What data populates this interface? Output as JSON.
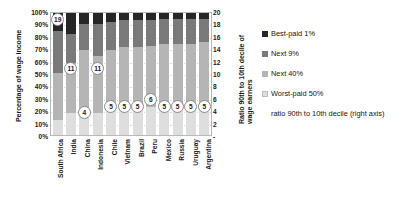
{
  "chart_data": {
    "type": "bar",
    "subtype": "stacked-100-percent-with-secondary-axis-markers",
    "title": "",
    "xlabel": "",
    "ylabel": "Percentage of wage income",
    "y2label": "Ratio 90th to 10th decile of wage earners",
    "ylim": [
      0,
      100
    ],
    "y2lim": [
      0,
      20
    ],
    "grid": true,
    "legend_position": "right",
    "categories": [
      "South Africa",
      "India",
      "China",
      "Indonesia",
      "Chile",
      "Vietnam",
      "Brazil",
      "Peru",
      "Mexico",
      "Russia",
      "Uruguay",
      "Argentina"
    ],
    "ytick_labels": [
      "100%",
      "90%",
      "80%",
      "70%",
      "60%",
      "50%",
      "40%",
      "30%",
      "20%",
      "10%",
      "0%"
    ],
    "ytick_values": [
      100,
      90,
      80,
      70,
      60,
      50,
      40,
      30,
      20,
      10,
      0
    ],
    "y2tick_labels": [
      "20",
      "18",
      "16",
      "14",
      "12",
      "10",
      "8",
      "6",
      "4",
      "2",
      "-"
    ],
    "y2tick_values": [
      20,
      18,
      16,
      14,
      12,
      10,
      8,
      6,
      4,
      2,
      0
    ],
    "series": [
      {
        "name": "Best-paid 1%",
        "color": "#262626",
        "values": [
          15,
          17,
          9,
          9,
          7,
          6,
          6,
          6,
          5,
          5,
          5,
          5
        ]
      },
      {
        "name": "Next 9%",
        "color": "#7a7a7a",
        "values": [
          34,
          24,
          21,
          26,
          23,
          22,
          22,
          21,
          20,
          20,
          20,
          19
        ]
      },
      {
        "name": "Next 40%",
        "color": "#b5b5b5",
        "values": [
          39,
          41,
          51,
          47,
          49,
          50,
          50,
          50,
          52,
          52,
          52,
          53
        ]
      },
      {
        "name": "Worst-paid 50%",
        "color": "#dedede",
        "values": [
          12,
          18,
          19,
          18,
          21,
          22,
          22,
          23,
          23,
          23,
          23,
          23
        ]
      }
    ],
    "marker_series": {
      "name": "ratio 90th to 10th decile (right axis)",
      "values": [
        19,
        11,
        4,
        11,
        5,
        5,
        5,
        6,
        5,
        5,
        5,
        5
      ]
    },
    "legend": [
      {
        "label": "Best-paid 1%",
        "swatch": "sw0"
      },
      {
        "label": "Next 9%",
        "swatch": "sw1"
      },
      {
        "label": "Next 40%",
        "swatch": "sw2"
      },
      {
        "label": "Worst-paid 50%",
        "swatch": "sw3"
      },
      {
        "label": "ratio 90th to 10th decile (right axis)",
        "swatch": "sw4"
      }
    ]
  }
}
